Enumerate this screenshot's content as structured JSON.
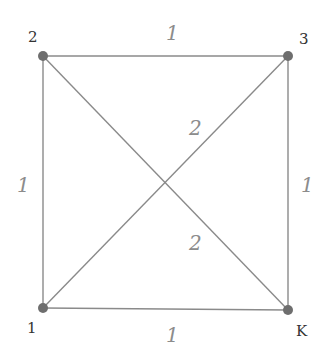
{
  "graph": {
    "type": "weighted-undirected-graph",
    "colors": {
      "edge": "#8a8a8a",
      "node": "#6e6e6e",
      "node_label": "#333333",
      "weight_label": "#8c8c8c",
      "background": "#ffffff"
    },
    "nodes": [
      {
        "id": "2",
        "label": "2",
        "x": 43,
        "y": 56
      },
      {
        "id": "3",
        "label": "3",
        "x": 288,
        "y": 56
      },
      {
        "id": "1",
        "label": "1",
        "x": 43,
        "y": 308
      },
      {
        "id": "K",
        "label": "K",
        "x": 288,
        "y": 310
      }
    ],
    "edges": [
      {
        "from": "2",
        "to": "3",
        "weight": "1"
      },
      {
        "from": "2",
        "to": "1",
        "weight": "1"
      },
      {
        "from": "3",
        "to": "K",
        "weight": "1"
      },
      {
        "from": "1",
        "to": "K",
        "weight": "1"
      },
      {
        "from": "1",
        "to": "3",
        "weight": "2"
      },
      {
        "from": "2",
        "to": "K",
        "weight": "2"
      }
    ]
  }
}
